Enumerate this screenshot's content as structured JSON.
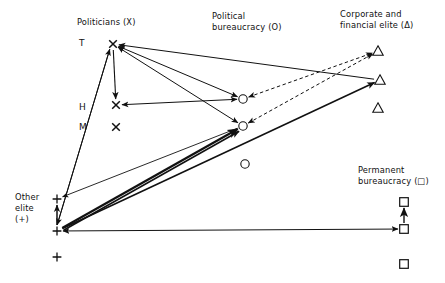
{
  "figure": {
    "title": "",
    "background_color": "#ffffff",
    "line_color": "#111111",
    "width": 445,
    "height": 283
  },
  "labels": {
    "politicians": "Politicians (X)",
    "political_bureaucracy_l1": "Political",
    "political_bureaucracy_l2": "bureaucracy (O)",
    "corporate_elite_l1": "Corporate and",
    "corporate_elite_l2": "financial elite (Δ)",
    "permanent_bureaucracy_l1": "Permanent",
    "permanent_bureaucracy_l2": "bureaucracy (□)",
    "other_elite_l1": "Other",
    "other_elite_l2": "elite",
    "other_elite_l3": "(+)"
  },
  "axis_levels": [
    {
      "id": "T",
      "label": "T",
      "x": 79,
      "y": 38
    },
    {
      "id": "H",
      "label": "H",
      "x": 79,
      "y": 102
    },
    {
      "id": "M",
      "label": "M",
      "x": 79,
      "y": 122
    }
  ],
  "nodes": [
    {
      "id": "x-top",
      "group": "politicians",
      "symbol": "x",
      "x": 113,
      "y": 44
    },
    {
      "id": "x-mid",
      "group": "politicians",
      "symbol": "x",
      "x": 116,
      "y": 105
    },
    {
      "id": "x-low",
      "group": "politicians",
      "symbol": "x",
      "x": 116,
      "y": 127
    },
    {
      "id": "o-top",
      "group": "political-bureaucracy",
      "symbol": "circle",
      "x": 243,
      "y": 99
    },
    {
      "id": "o-mid",
      "group": "political-bureaucracy",
      "symbol": "circle",
      "x": 243,
      "y": 126
    },
    {
      "id": "o-low",
      "group": "political-bureaucracy",
      "symbol": "circle",
      "x": 245,
      "y": 164
    },
    {
      "id": "tri-top",
      "group": "corporate-elite",
      "symbol": "triangle",
      "x": 378,
      "y": 51
    },
    {
      "id": "tri-mid",
      "group": "corporate-elite",
      "symbol": "triangle",
      "x": 380,
      "y": 80
    },
    {
      "id": "tri-low",
      "group": "corporate-elite",
      "symbol": "triangle",
      "x": 378,
      "y": 108
    },
    {
      "id": "sq-top",
      "group": "permanent-bureaucracy",
      "symbol": "square",
      "x": 404,
      "y": 202
    },
    {
      "id": "sq-mid",
      "group": "permanent-bureaucracy",
      "symbol": "square",
      "x": 404,
      "y": 229
    },
    {
      "id": "sq-low",
      "group": "permanent-bureaucracy",
      "symbol": "square",
      "x": 404,
      "y": 264
    },
    {
      "id": "plus-top",
      "group": "other-elite",
      "symbol": "plus",
      "x": 57,
      "y": 199
    },
    {
      "id": "plus-mid",
      "group": "other-elite",
      "symbol": "plus",
      "x": 57,
      "y": 231
    },
    {
      "id": "plus-low",
      "group": "other-elite",
      "symbol": "plus",
      "x": 57,
      "y": 257
    }
  ],
  "edges": [
    {
      "id": "e1",
      "from": "x-top",
      "to": "x-mid",
      "style": "solid",
      "arrows": "end",
      "weight": 1.1
    },
    {
      "id": "e2",
      "from": "x-mid",
      "to": "o-top",
      "style": "solid",
      "arrows": "both",
      "weight": 1.0
    },
    {
      "id": "e3",
      "from": "x-top",
      "to": "o-top",
      "style": "solid",
      "arrows": "both",
      "weight": 1.0
    },
    {
      "id": "e4",
      "from": "x-top",
      "to": "o-mid",
      "style": "solid",
      "arrows": "both",
      "weight": 1.0
    },
    {
      "id": "e5",
      "from": "x-top",
      "to": "tri-mid",
      "style": "solid",
      "arrows": "start",
      "weight": 1.0
    },
    {
      "id": "e6",
      "from": "o-top",
      "to": "tri-top",
      "style": "dashed",
      "arrows": "both",
      "weight": 1.0
    },
    {
      "id": "e7",
      "from": "o-mid",
      "to": "tri-top",
      "style": "dashed",
      "arrows": "both",
      "weight": 1.0
    },
    {
      "id": "e8",
      "from": "plus-mid",
      "to": "o-mid",
      "style": "solid",
      "arrows": "end",
      "weight": 2.2
    },
    {
      "id": "e9",
      "from": "plus-mid",
      "to": "o-mid",
      "style": "solid",
      "arrows": "end",
      "weight": 1.6
    },
    {
      "id": "e10",
      "from": "plus-mid",
      "to": "tri-mid",
      "style": "solid",
      "arrows": "end",
      "weight": 1.6
    },
    {
      "id": "e11",
      "from": "o-mid",
      "to": "plus-top",
      "style": "solid",
      "arrows": "end",
      "weight": 0.9
    },
    {
      "id": "e12",
      "from": "x-top",
      "to": "plus-mid",
      "style": "solid",
      "arrows": "end",
      "weight": 1.0
    },
    {
      "id": "e13",
      "from": "plus-mid",
      "to": "x-top",
      "style": "solid",
      "arrows": "end",
      "weight": 1.0
    },
    {
      "id": "e14",
      "from": "plus-mid",
      "to": "plus-top",
      "style": "solid",
      "arrows": "end",
      "weight": 1.5
    },
    {
      "id": "e15",
      "from": "plus-mid",
      "to": "sq-mid",
      "style": "solid",
      "arrows": "both",
      "weight": 1.0
    },
    {
      "id": "e16",
      "from": "sq-mid",
      "to": "sq-top",
      "style": "solid",
      "arrows": "end",
      "weight": 1.4
    }
  ],
  "chart_data": {
    "type": "diagram",
    "groups": [
      {
        "name": "Politicians",
        "symbol": "X",
        "count": 3
      },
      {
        "name": "Political bureaucracy",
        "symbol": "O",
        "count": 3
      },
      {
        "name": "Corporate and financial elite",
        "symbol": "Δ",
        "count": 3
      },
      {
        "name": "Permanent bureaucracy",
        "symbol": "□",
        "count": 3
      },
      {
        "name": "Other elite",
        "symbol": "+",
        "count": 3
      }
    ],
    "vertical_axis_ticks": [
      "T",
      "H",
      "M"
    ],
    "legend_position": "top",
    "grid": false
  }
}
